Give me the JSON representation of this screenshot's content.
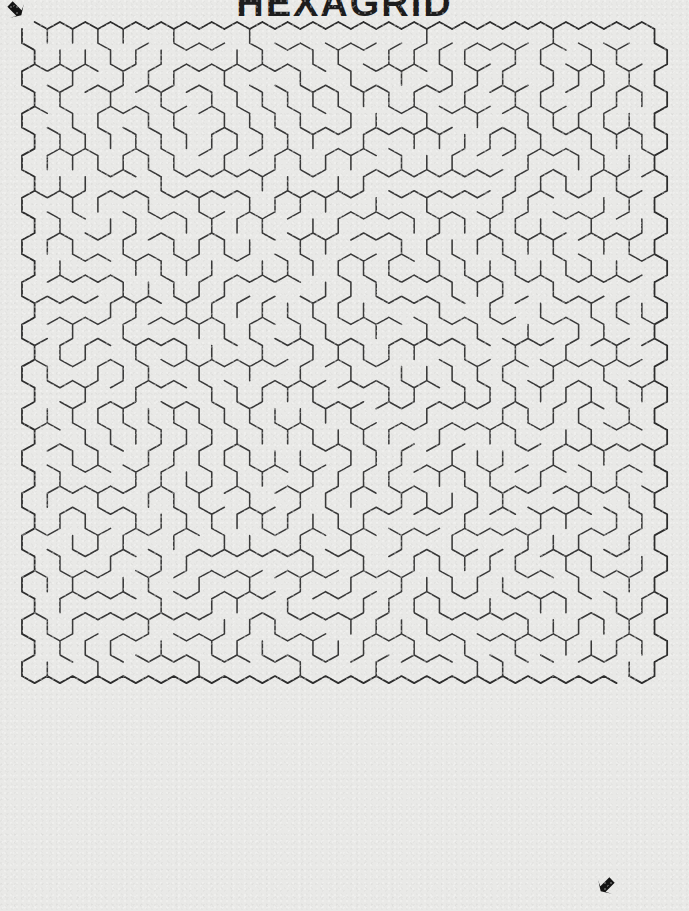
{
  "page": {
    "title": "HEXAGRID",
    "background_color": "#e9e9e7",
    "width": 689,
    "height": 911
  },
  "maze": {
    "kind": "hexagonal-maze",
    "orientation": "pointy-top",
    "columns": 25,
    "rows": 31,
    "cell_width": 25.3,
    "cell_height": 28.1,
    "row_pitch": 21.1,
    "origin_x": 22,
    "origin_y": 22,
    "wall_color": "#3a3a3a",
    "border_color": "#2e2e2e",
    "wall_width": 1.55,
    "seed": 20240117,
    "entrance": {
      "label": "entrance",
      "arrow_x": 22,
      "arrow_y": 8,
      "direction": "down-right",
      "cell_col": 0,
      "cell_row": 0
    },
    "exit": {
      "label": "exit",
      "arrow_x": 600,
      "arrow_y": 884,
      "direction": "down-left",
      "cell_col": 23,
      "cell_row": 30
    }
  }
}
